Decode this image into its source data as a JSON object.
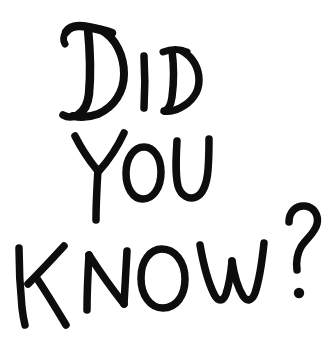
{
  "image": {
    "kind": "handwritten-text-graphic",
    "alt_text": "DID YOU KNOW?",
    "full_text": "DID YOU KNOW?",
    "background_color": "#ffffff",
    "ink_color": "#0d0d0d",
    "width": 336,
    "height": 343
  },
  "lines": [
    {
      "id": "line-1",
      "text": "DID",
      "glyphs": [
        {
          "char": "D",
          "size": "large"
        },
        {
          "char": "I",
          "size": "small"
        },
        {
          "char": "D",
          "size": "small"
        }
      ]
    },
    {
      "id": "line-2",
      "text": "YOU",
      "glyphs": [
        {
          "char": "Y",
          "size": "large"
        },
        {
          "char": "O",
          "size": "small"
        },
        {
          "char": "U",
          "size": "small"
        }
      ]
    },
    {
      "id": "line-3",
      "text": "KNOW?",
      "glyphs": [
        {
          "char": "K",
          "size": "large"
        },
        {
          "char": "N",
          "size": "small"
        },
        {
          "char": "O",
          "size": "small"
        },
        {
          "char": "W",
          "size": "small"
        },
        {
          "char": "?",
          "size": "large"
        }
      ]
    }
  ]
}
